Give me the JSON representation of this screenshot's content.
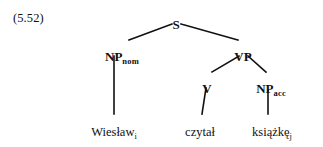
{
  "example": {
    "number": "(5.52)"
  },
  "tree": {
    "nodes": [
      {
        "id": "s",
        "label": "S",
        "subscript": "",
        "x": 176,
        "y": 16
      },
      {
        "id": "np-nom",
        "label": "NP",
        "subscript": "nom",
        "x": 122,
        "y": 48
      },
      {
        "id": "vp",
        "label": "VP",
        "subscript": "",
        "x": 243,
        "y": 48
      },
      {
        "id": "v",
        "label": "V",
        "subscript": "",
        "x": 207,
        "y": 80
      },
      {
        "id": "np-acc",
        "label": "NP",
        "subscript": "acc",
        "x": 271,
        "y": 80
      }
    ],
    "terminals": [
      {
        "id": "wieslaw",
        "word": "Wiesław",
        "subscript": "i",
        "x": 114,
        "y": 126
      },
      {
        "id": "czytal",
        "word": "czytał",
        "subscript": "",
        "x": 200,
        "y": 126
      },
      {
        "id": "ksiazke",
        "word": "książkę",
        "subscript": "j",
        "x": 272,
        "y": 126
      }
    ],
    "edges": [
      {
        "id": "s-to-np-nom",
        "x1": 172,
        "y1": 24,
        "x2": 129,
        "y2": 40
      },
      {
        "id": "s-to-vp",
        "x1": 181,
        "y1": 24,
        "x2": 238,
        "y2": 40
      },
      {
        "id": "np-nom-to-wieslaw",
        "x1": 114,
        "y1": 56,
        "x2": 114,
        "y2": 114
      },
      {
        "id": "vp-to-v",
        "x1": 239,
        "y1": 56,
        "x2": 212,
        "y2": 72
      },
      {
        "id": "vp-to-np-acc",
        "x1": 248,
        "y1": 56,
        "x2": 266,
        "y2": 72
      },
      {
        "id": "v-to-czytal",
        "x1": 206,
        "y1": 88,
        "x2": 202,
        "y2": 114
      },
      {
        "id": "np-acc-to-ksiazke",
        "x1": 268,
        "y1": 90,
        "x2": 268,
        "y2": 114
      }
    ],
    "line_color": "#111111",
    "line_width": 1.6
  }
}
